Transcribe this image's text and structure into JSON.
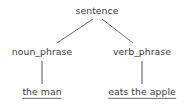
{
  "figure": {
    "kind": "syntax-parse-tree",
    "background_color": "#ffffff",
    "text_color": "#3a3a3a",
    "edge_color": "#6e6e6e"
  },
  "tree": {
    "root": {
      "id": "sentence",
      "label": "sentence",
      "x": 97,
      "y": 11
    },
    "nonterminals": [
      {
        "id": "noun_phrase",
        "label": "noun_phrase",
        "x": 42,
        "y": 52
      },
      {
        "id": "verb_phrase",
        "label": "verb_phrase",
        "x": 142,
        "y": 52
      }
    ],
    "leaves": [
      {
        "id": "the_man",
        "label": "the man",
        "x": 42,
        "y": 93,
        "underlined": true
      },
      {
        "id": "eats_the_apple",
        "label": "eats the apple",
        "x": 142,
        "y": 93,
        "underlined": true
      }
    ],
    "edges": [
      {
        "from": "sentence",
        "to": "noun_phrase",
        "x1": 93,
        "y1": 19,
        "x2": 57,
        "y2": 43,
        "style": "diagonal"
      },
      {
        "from": "sentence",
        "to": "verb_phrase",
        "x1": 102,
        "y1": 19,
        "x2": 133,
        "y2": 43,
        "style": "diagonal"
      },
      {
        "from": "noun_phrase",
        "to": "the_man",
        "x1": 42,
        "y1": 61,
        "x2": 42,
        "y2": 84,
        "style": "vertical"
      },
      {
        "from": "verb_phrase",
        "to": "eats_the_apple",
        "x1": 142,
        "y1": 61,
        "x2": 142,
        "y2": 84,
        "style": "vertical"
      }
    ]
  }
}
